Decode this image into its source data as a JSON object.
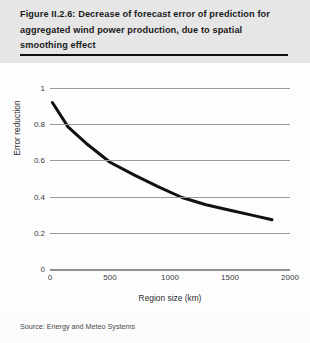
{
  "figure": {
    "title": "Figure II.2.6: Decrease of forecast error of prediction for aggregated wind power production, due to spatial smoothing effect",
    "source": "Source: Energy and Meteo Systems"
  },
  "chart_data": {
    "type": "line",
    "title": "",
    "xlabel": "Region size (km)",
    "ylabel": "Error reduction",
    "xlim": [
      0,
      2000
    ],
    "ylim": [
      0,
      1
    ],
    "xticks": [
      0,
      500,
      1000,
      1500,
      2000
    ],
    "yticks": [
      0,
      0.2,
      0.4,
      0.6,
      0.8,
      1
    ],
    "xtick_labels": [
      "0",
      "500",
      "1000",
      "1500",
      "2000"
    ],
    "ytick_labels": [
      "0",
      "0.2",
      "0.4",
      "0.6",
      "0.8",
      "1"
    ],
    "grid": "horizontal",
    "legend": "none",
    "line_color": "#111111",
    "line_width": 3,
    "series": [
      {
        "name": "Error reduction",
        "x": [
          20,
          150,
          300,
          500,
          700,
          900,
          1100,
          1300,
          1500,
          1700,
          1850
        ],
        "y": [
          0.92,
          0.785,
          0.695,
          0.59,
          0.52,
          0.455,
          0.395,
          0.355,
          0.325,
          0.295,
          0.272
        ]
      }
    ]
  }
}
